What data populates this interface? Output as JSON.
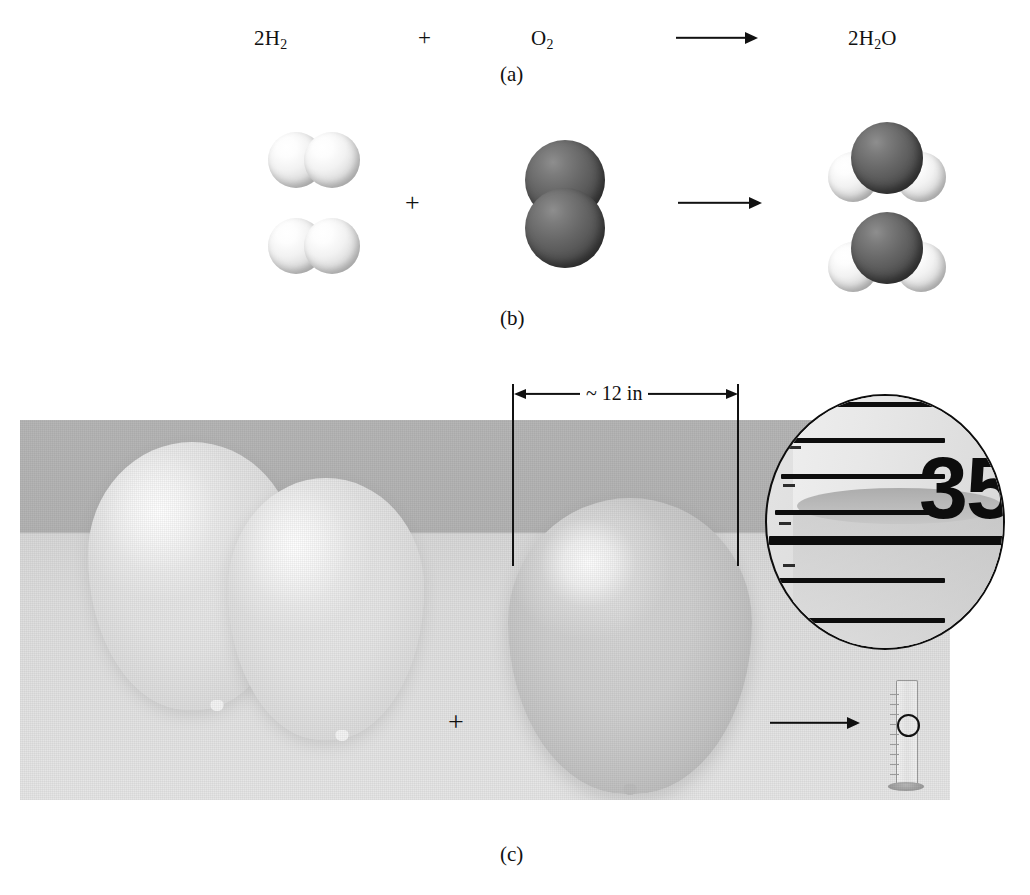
{
  "figure": {
    "panels": [
      {
        "id": "a",
        "label": "(a)",
        "kind": "symbolic-equation",
        "equation": {
          "reactant_1": "2H₂",
          "plus": "+",
          "reactant_2": "O₂",
          "arrow": "⟶",
          "product": "2H₂O"
        }
      },
      {
        "id": "b",
        "label": "(b)",
        "kind": "molecular-models",
        "equation": {
          "reactant_1_description": "two hydrogen molecules",
          "plus": "+",
          "reactant_2_description": "one oxygen molecule",
          "arrow": "⟶",
          "product_description": "two water molecules"
        }
      },
      {
        "id": "c",
        "label": "(c)",
        "kind": "macroscopic-photograph",
        "equation": {
          "reactant_1_description": "two balloons of hydrogen gas",
          "plus": "+",
          "reactant_2_description": "one balloon of oxygen gas",
          "arrow": "⟶",
          "product_description": "graduated cylinder of water"
        },
        "dimension": {
          "label": "~ 12 in"
        },
        "magnifier": {
          "reading": "35",
          "caption_description": "magnified view of graduated cylinder scale at the meniscus"
        }
      }
    ]
  },
  "colors": {
    "hydrogen_atom": "#e8e8e8",
    "oxygen_atom": "#585858",
    "ink": "#111111",
    "photo_background_upper": "#b4b4b4",
    "photo_background_lower": "#e0e0e0"
  }
}
